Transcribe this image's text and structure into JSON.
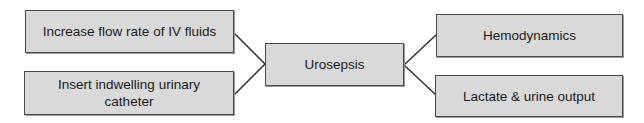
{
  "diagram": {
    "type": "concept-map",
    "center": {
      "label": "Urosepsis"
    },
    "left_nodes": [
      {
        "label": "Increase flow rate of IV fluids"
      },
      {
        "label": "Insert indwelling urinary catheter"
      }
    ],
    "right_nodes": [
      {
        "label": "Hemodynamics"
      },
      {
        "label": "Lactate & urine output"
      }
    ],
    "edges": [
      {
        "from": "Increase flow rate of IV fluids",
        "to": "Urosepsis"
      },
      {
        "from": "Insert indwelling urinary catheter",
        "to": "Urosepsis"
      },
      {
        "from": "Urosepsis",
        "to": "Hemodynamics"
      },
      {
        "from": "Urosepsis",
        "to": "Lactate & urine output"
      }
    ],
    "colors": {
      "node_fill": "#d9d9d9",
      "node_border": "#4a4a4a",
      "edge": "#2b2b2b",
      "text": "#1a1a1a",
      "background": "#ffffff"
    }
  }
}
